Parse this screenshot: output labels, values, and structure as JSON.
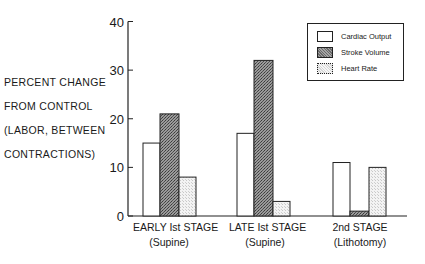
{
  "chart_data": {
    "type": "bar",
    "title": "",
    "xlabel": "",
    "ylabel": "PERCENT CHANGE FROM CONTROL (LABOR, BETWEEN CONTRACTIONS)",
    "ylabel_lines": [
      "PERCENT CHANGE",
      "FROM CONTROL",
      "(LABOR, BETWEEN",
      "CONTRACTIONS)"
    ],
    "ylim": [
      0,
      40
    ],
    "yticks": [
      0,
      10,
      20,
      30,
      40
    ],
    "ytick_labels": [
      "0",
      "10",
      "20",
      "30",
      "40"
    ],
    "grid": false,
    "legend_position": "upper right",
    "categories": [
      "EARLY Ist STAGE (Supine)",
      "LATE Ist STAGE (Supine)",
      "2nd STAGE (Lithotomy)"
    ],
    "category_lines": [
      [
        "EARLY Ist STAGE",
        "(Supine)"
      ],
      [
        "LATE Ist STAGE",
        "(Supine)"
      ],
      [
        "2nd  STAGE",
        "(Lithotomy)"
      ]
    ],
    "series": [
      {
        "name": "Cardiac Output",
        "fill": "white",
        "values": [
          15,
          17,
          11
        ]
      },
      {
        "name": "Stroke Volume",
        "fill": "dark-stipple",
        "values": [
          21,
          32,
          1
        ]
      },
      {
        "name": "Heart Rate",
        "fill": "light-stipple",
        "values": [
          8,
          3,
          10
        ]
      }
    ]
  },
  "legend": {
    "items": [
      {
        "label": "Cardiac Output",
        "swatch": "white"
      },
      {
        "label": "Stroke Volume",
        "swatch": "dark-stipple"
      },
      {
        "label": "Heart Rate",
        "swatch": "light-stipple"
      }
    ]
  }
}
